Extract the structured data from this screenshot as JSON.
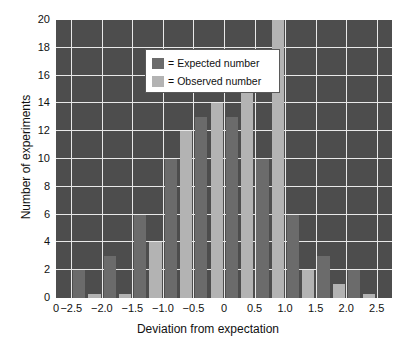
{
  "chart_data": {
    "type": "bar",
    "title": "",
    "xlabel": "Deviation from expectation",
    "ylabel": "Number of experiments",
    "xlim": [
      -2.75,
      2.75
    ],
    "ylim": [
      0,
      20
    ],
    "grid": true,
    "legend_position": "top-left",
    "bin_width": 0.5,
    "categories": [
      -2.25,
      -1.75,
      -1.25,
      -0.75,
      -0.25,
      0.25,
      0.75,
      1.25,
      1.75,
      2.25
    ],
    "series": [
      {
        "name": "Expected number",
        "color": "#6b6b6b",
        "values": [
          2,
          3,
          6,
          10,
          13,
          13,
          10,
          6,
          3,
          2
        ]
      },
      {
        "name": "Observed number",
        "color": "#b3b3b3",
        "values": [
          0.3,
          0.3,
          4,
          12,
          14,
          16,
          20,
          2,
          1,
          0.3
        ]
      }
    ],
    "xticks": [
      {
        "value": -2.75,
        "label": "0"
      },
      {
        "value": -2.5,
        "label": "−2.5"
      },
      {
        "value": -2.0,
        "label": "−2.0"
      },
      {
        "value": -1.5,
        "label": "−1.5"
      },
      {
        "value": -1.0,
        "label": "−1.0"
      },
      {
        "value": -0.5,
        "label": "−0.5"
      },
      {
        "value": 0.0,
        "label": "0"
      },
      {
        "value": 0.5,
        "label": "0.5"
      },
      {
        "value": 1.0,
        "label": "1.0"
      },
      {
        "value": 1.5,
        "label": "1.5"
      },
      {
        "value": 2.0,
        "label": "2.0"
      },
      {
        "value": 2.5,
        "label": "2.5"
      }
    ],
    "yticks": [
      {
        "value": 0,
        "label": "0"
      },
      {
        "value": 2,
        "label": "2"
      },
      {
        "value": 4,
        "label": "4"
      },
      {
        "value": 6,
        "label": "6"
      },
      {
        "value": 8,
        "label": "8"
      },
      {
        "value": 10,
        "label": "10"
      },
      {
        "value": 12,
        "label": "12"
      },
      {
        "value": 14,
        "label": "14"
      },
      {
        "value": 16,
        "label": "16"
      },
      {
        "value": 18,
        "label": "18"
      },
      {
        "value": 20,
        "label": "20"
      }
    ]
  },
  "legend": {
    "equals": "=",
    "entries": [
      {
        "label": "Expected number",
        "swatch": "expected"
      },
      {
        "label": "Observed number",
        "swatch": "observed"
      }
    ]
  },
  "colors": {
    "plot_background": "#4d4d4d",
    "gridline": "#e8e8e8",
    "expected": "#6b6b6b",
    "observed": "#b3b3b3",
    "text": "#111111",
    "page_background": "#ffffff"
  }
}
